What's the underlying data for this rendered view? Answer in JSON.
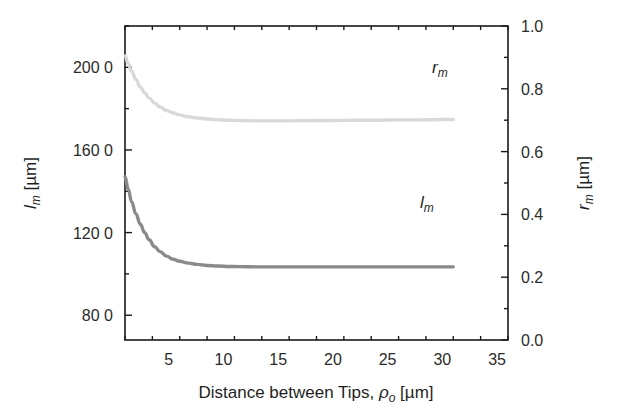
{
  "chart_data": {
    "type": "line",
    "title": "",
    "xlabel": "Distance between Tips, ρo [µm]",
    "ylabel_left": "lm [µm]",
    "ylabel_right": "rm [µm]",
    "xlim": [
      1.0,
      36.0
    ],
    "ylim_left": [
      68.0,
      220.0
    ],
    "ylim_right": [
      0.0,
      1.0
    ],
    "grid": false,
    "legend_position": "inline-annotations",
    "x_ticks": [
      5,
      10,
      15,
      20,
      25,
      30,
      35
    ],
    "x_tick_labels": [
      "5",
      "10",
      "15",
      "20",
      "25",
      "30",
      "35"
    ],
    "x_minor_step": 2.5,
    "y_left_ticks": [
      80,
      120,
      160,
      200
    ],
    "y_left_tick_labels": [
      "80 0",
      "120 0",
      "160 0",
      "200 0"
    ],
    "y_left_minor_step": 20,
    "y_right_ticks": [
      0.0,
      0.2,
      0.4,
      0.6,
      0.8,
      1.0
    ],
    "y_right_tick_labels": [
      "0.0",
      "0.2",
      "0.4",
      "0.6",
      "0.8",
      "1.0"
    ],
    "y_right_minor_step": 0.1,
    "series": [
      {
        "name": "rm",
        "annotation": "rm",
        "axis": "right",
        "color": "#d9d9d9",
        "linewidth": 3.4,
        "x": [
          1.0,
          1.3,
          1.6,
          2.0,
          2.4,
          2.8,
          3.2,
          3.7,
          4.2,
          4.8,
          5.4,
          6.0,
          6.8,
          7.6,
          8.5,
          9.5,
          10.5,
          11.5,
          13.0,
          14.5,
          16.0,
          18.0,
          20.0,
          22.0,
          24.0,
          26.0,
          28.0,
          30.0,
          31.0
        ],
        "y": [
          0.905,
          0.88,
          0.856,
          0.83,
          0.806,
          0.787,
          0.771,
          0.755,
          0.742,
          0.731,
          0.723,
          0.717,
          0.711,
          0.707,
          0.704,
          0.701,
          0.7,
          0.699,
          0.698,
          0.698,
          0.698,
          0.699,
          0.699,
          0.7,
          0.7,
          0.701,
          0.701,
          0.702,
          0.702
        ]
      },
      {
        "name": "lm",
        "annotation": "lm",
        "axis": "left",
        "color": "#8a8a8a",
        "linewidth": 3.4,
        "x": [
          1.0,
          1.3,
          1.6,
          2.0,
          2.4,
          2.8,
          3.2,
          3.7,
          4.2,
          4.8,
          5.4,
          6.0,
          6.8,
          7.6,
          8.5,
          9.5,
          10.5,
          11.5,
          13.0,
          14.5,
          16.0,
          18.0,
          20.0,
          22.0,
          24.0,
          26.0,
          28.0,
          30.0,
          31.0
        ],
        "y": [
          147.0,
          141.0,
          135.0,
          129.0,
          124.0,
          120.0,
          116.5,
          113.2,
          110.8,
          108.6,
          107.1,
          106.1,
          105.2,
          104.6,
          104.1,
          103.8,
          103.6,
          103.5,
          103.4,
          103.4,
          103.4,
          103.4,
          103.4,
          103.4,
          103.4,
          103.4,
          103.4,
          103.4,
          103.4
        ]
      }
    ],
    "annotations": [
      {
        "text": "rm",
        "x_px": 432,
        "y_px": 73
      },
      {
        "text": "lm",
        "x_px": 420,
        "y_px": 208
      }
    ]
  },
  "labels": {
    "x_title_main": "Distance between Tips, ",
    "x_title_rho": "ρ",
    "x_title_rho_sub": "o",
    "x_title_unit": " [µm]",
    "y_left_var": "l",
    "y_left_sub": "m",
    "y_left_unit": " [µm]",
    "y_right_var": "r",
    "y_right_sub": "m",
    "y_right_unit": " [µm]",
    "annot_rm_var": "r",
    "annot_rm_sub": "m",
    "annot_lm_var": "l",
    "annot_lm_sub": "m"
  },
  "colors": {
    "axis": "#1a1a1a",
    "rm_curve": "#d9d9d9",
    "lm_curve": "#8a8a8a",
    "background": "#ffffff"
  }
}
